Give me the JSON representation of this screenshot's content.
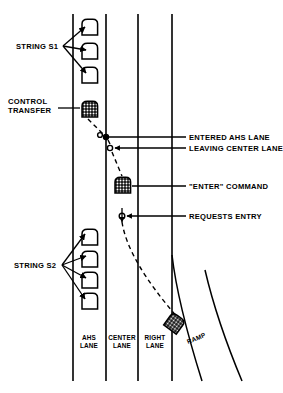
{
  "diagram": {
    "background_color": "#ffffff",
    "line_color": "#000000",
    "annotations": {
      "string_s1": "STRING S1",
      "control_transfer_line1": "CONTROL",
      "control_transfer_line2": "TRANSFER",
      "string_s2": "STRING S2",
      "entered_ahs_lane": "ENTERED AHS LANE",
      "leaving_center_lane": "LEAVING CENTER LANE",
      "enter_command": "\"ENTER\" COMMAND",
      "requests_entry": "REQUESTS ENTRY"
    },
    "lane_labels": {
      "ahs_line1": "AHS",
      "ahs_line2": "LANE",
      "center_line1": "CENTER",
      "center_line2": "LANE",
      "right_line1": "RIGHT",
      "right_line2": "LANE",
      "ramp": "RAMP"
    },
    "lanes": [
      {
        "name": "ahs-lane",
        "left_x": 73,
        "right_x": 106
      },
      {
        "name": "center-lane",
        "left_x": 106,
        "right_x": 138
      },
      {
        "name": "right-lane",
        "left_x": 138,
        "right_x": 172
      }
    ],
    "vehicles": {
      "string_s1_count": 3,
      "string_s2_count": 4,
      "control_transfer_style": "stippled",
      "enter_command_style": "stippled",
      "ramp_vehicle_style": "stippled"
    },
    "event_markers": [
      {
        "name": "entered-ahs-lane",
        "style": "solid",
        "x": 106,
        "y": 137
      },
      {
        "name": "leaving-center-lane",
        "style": "open",
        "x": 110,
        "y": 148
      },
      {
        "name": "requests-entry",
        "style": "open",
        "x": 122,
        "y": 216
      }
    ],
    "trajectory": "dashed lane-change path from ramp vehicle across right and center lanes into AHS lane"
  }
}
